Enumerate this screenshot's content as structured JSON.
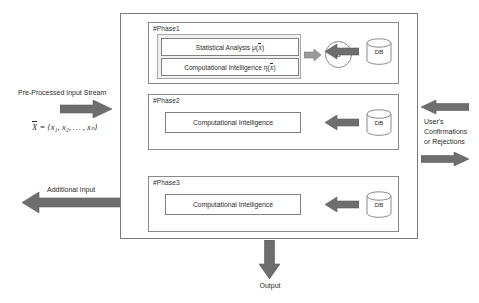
{
  "diagram": {
    "colors": {
      "arrow_fill": "#6e6e6e",
      "arrow_stroke": "#5a5a5a",
      "box_stroke": "#808080",
      "frame_stroke": "#7b7b7b",
      "group_fill": "#f1f1f1",
      "text": "#2b2b2b",
      "background": "#ffffff"
    },
    "phases": [
      {
        "id": "phase-1",
        "label": "#Phase1",
        "boxes": [
          {
            "id": "statistical-analysis",
            "text": "Statistical Analysis μ(",
            "var": "X",
            "text_tail": ")"
          },
          {
            "id": "computational-intelligence",
            "text": "Computational Intelligence  η(",
            "var": "X",
            "text_tail": ")"
          }
        ],
        "node": {
          "id": "b-node",
          "label": "b"
        },
        "db": {
          "id": "db-1",
          "label": "DB"
        }
      },
      {
        "id": "phase-2",
        "label": "#Phase2",
        "boxes": [
          {
            "id": "computational-intelligence",
            "text": "Computational Intelligence"
          }
        ],
        "db": {
          "id": "db-2",
          "label": "DB"
        }
      },
      {
        "id": "phase-3",
        "label": "#Phase3",
        "boxes": [
          {
            "id": "computational-intelligence",
            "text": "Computational Intelligence"
          }
        ],
        "db": {
          "id": "db-3",
          "label": "DB"
        }
      }
    ],
    "labels": {
      "input_stream": "Pre-Processed Input Stream",
      "input_formula_lhs": "X",
      "input_formula_rhs": " = {x₁, x₂, … , xₙ}",
      "additional_input": "Additional Input",
      "user_feedback_line1": "User's",
      "user_feedback_line2": "Confirmations",
      "user_feedback_line3": "or Rejections",
      "output": "Output"
    }
  }
}
